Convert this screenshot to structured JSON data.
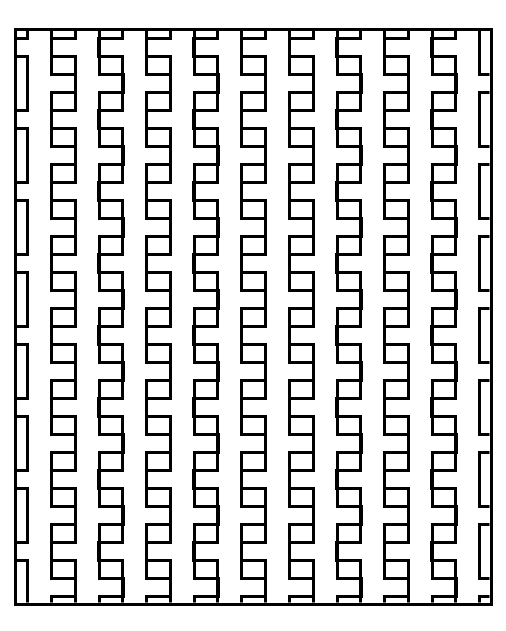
{
  "image": {
    "title": "Interlocking Comb Tessellation Pattern",
    "kind": "geometric-line-pattern",
    "width": 506,
    "height": 631,
    "background_color": "#ffffff",
    "stroke_color": "#000000",
    "stroke_width": 3
  },
  "frame": {
    "label": "outer-border-rectangle",
    "x": 15,
    "y": 29,
    "width": 476,
    "height": 575,
    "stroke_color": "#000000",
    "stroke_width": 3,
    "fill": "none"
  },
  "pattern": {
    "label": "comb-tessellation",
    "motif_name": "interlocking-bracket-comb",
    "description": "Vertical stems with rectangular tabs alternating to the left and right, tiled into columns and rows so adjacent columns interlock.",
    "columns": 10,
    "rows": 16,
    "column_pitch": 47.6,
    "row_pitch": 36.0,
    "first_column_center_x": 39.5,
    "first_row_top_y": 29,
    "stem_width": 24,
    "tab_width": 24,
    "tab_height": 18,
    "gap_height": 18,
    "stroke_color": "#000000",
    "stroke_width": 3,
    "fill_color": "#ffffff"
  },
  "chart_data": {
    "type": "table",
    "xlabel": "column index",
    "ylabel": "row index",
    "columns": [
      "column_index",
      "center_x",
      "tab_side_even_rows",
      "tab_side_odd_rows"
    ],
    "rows": [
      [
        1,
        39.5,
        "left",
        "right"
      ],
      [
        2,
        87.1,
        "left",
        "right"
      ],
      [
        3,
        134.7,
        "left",
        "right"
      ],
      [
        4,
        182.3,
        "left",
        "right"
      ],
      [
        5,
        229.9,
        "left",
        "right"
      ],
      [
        6,
        277.5,
        "left",
        "right"
      ],
      [
        7,
        325.1,
        "left",
        "right"
      ],
      [
        8,
        372.7,
        "left",
        "right"
      ],
      [
        9,
        420.3,
        "left",
        "right"
      ],
      [
        10,
        467.9,
        "left",
        "right"
      ]
    ],
    "row_y_positions": [
      29,
      65,
      101,
      137,
      173,
      209,
      245,
      281,
      317,
      353,
      389,
      425,
      461,
      497,
      533,
      569
    ],
    "grid": false,
    "legend": "none"
  }
}
